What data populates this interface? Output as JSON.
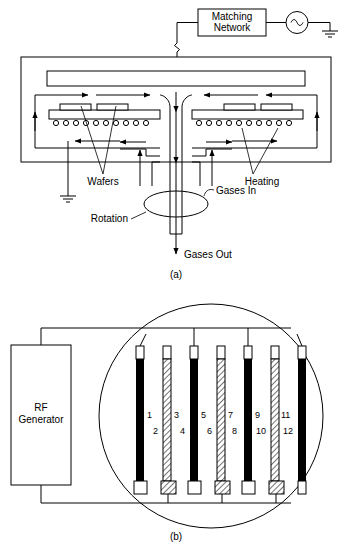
{
  "figure": {
    "panels": [
      {
        "id": "a",
        "caption": "(a)",
        "labels": {
          "matching_network": "Matching\nNetwork",
          "matching_network_line1": "Matching",
          "matching_network_line2": "Network",
          "wafers": "Wafers",
          "heating": "Heating",
          "gases_in": "Gases In",
          "gases_out": "Gases Out",
          "rotation": "Rotation"
        },
        "icons": {
          "rf_source": "ac-source-icon",
          "ground_right": "ground-icon",
          "ground_left": "ground-icon"
        }
      },
      {
        "id": "b",
        "caption": "(b)",
        "labels": {
          "rf_generator_line1": "RF",
          "rf_generator_line2": "Generator",
          "rf_generator": "RF Generator"
        },
        "electrode_numbers": [
          "1",
          "2",
          "3",
          "4",
          "5",
          "6",
          "7",
          "8",
          "9",
          "10",
          "11",
          "12"
        ],
        "electrode_count": 7
      }
    ],
    "colors": {
      "ink": "#000000",
      "paper": "#ffffff"
    }
  }
}
